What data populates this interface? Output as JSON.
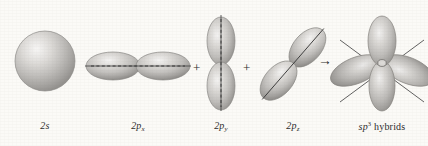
{
  "figure": {
    "background_color": "#fbfaf7",
    "orbital_fill_light": "#efeeec",
    "orbital_fill_mid": "#b9b7b4",
    "orbital_fill_dark": "#8b8986",
    "axis_color": "#3a3a3a",
    "text_color": "#2b2b2b"
  },
  "operators": {
    "plus_1": "+",
    "plus_2": "+",
    "plus_3": "+",
    "arrow": "→"
  },
  "orbitals": [
    {
      "id": "2s",
      "shape": "sphere",
      "label_prefix": "2",
      "label_letter": "s",
      "label_subscript": "",
      "label_text": "2s",
      "orientation": "spherical",
      "lobes": 1
    },
    {
      "id": "2px",
      "shape": "dumbbell",
      "label_prefix": "2",
      "label_letter": "p",
      "label_subscript": "x",
      "label_text": "2px",
      "orientation": "horizontal",
      "lobes": 2
    },
    {
      "id": "2py",
      "shape": "dumbbell",
      "label_prefix": "2",
      "label_letter": "p",
      "label_subscript": "y",
      "label_text": "2py",
      "orientation": "vertical",
      "lobes": 2
    },
    {
      "id": "2pz",
      "shape": "dumbbell",
      "label_prefix": "2",
      "label_letter": "p",
      "label_subscript": "z",
      "label_text": "2pz",
      "orientation": "diagonal",
      "lobes": 2
    },
    {
      "id": "sp3",
      "shape": "tetrahedral-cluster",
      "label_prefix": "sp",
      "label_superscript": "3",
      "label_suffix": "hybrids",
      "label_text": "sp3 hybrids",
      "orientation": "tetrahedral",
      "lobes": 4
    }
  ]
}
